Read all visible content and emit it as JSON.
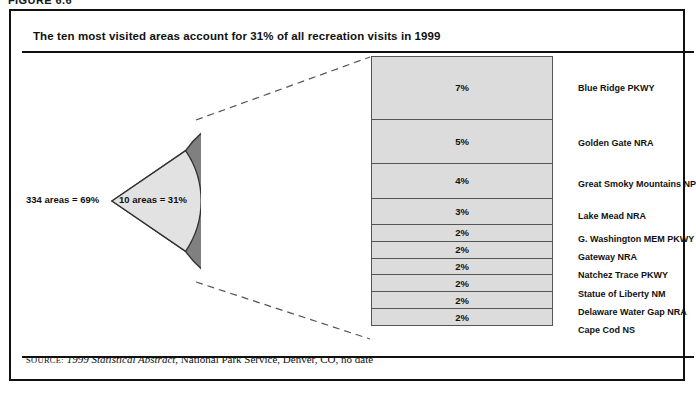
{
  "page": {
    "top_caption": "FIGURE 6.6",
    "panel_title": "The ten most visited areas account for 31% of all recreation visits in 1999"
  },
  "pie": {
    "major_label": "334 areas = 69%",
    "minor_label": "10 areas = 31%",
    "major_color": "#808080",
    "minor_color": "#e0e0e0",
    "outline_color": "#333333"
  },
  "source": {
    "kicker": "SOURCE:",
    "title": "1999 Statistical Abstract",
    "rest": ", National Park Service, Denver, CO, no date"
  },
  "chart_data": {
    "type": "bar",
    "title": "The ten most visited areas account for 31% of all recreation visits in 1999",
    "xlabel": "",
    "ylabel": "Share of all recreation visits",
    "orientation": "stacked-vertical",
    "grid": false,
    "legend": "none",
    "value_suffix": "%",
    "total": 31,
    "categories": [
      "Blue Ridge PKWY",
      "Golden Gate NRA",
      "Great Smoky Mountains NP",
      "Lake Mead NRA",
      "G. Washington MEM PKWY",
      "Gateway NRA",
      "Natchez Trace PKWY",
      "Statue of Liberty NM",
      "Delaware Water Gap NRA",
      "Cape Cod NS"
    ],
    "values": [
      7,
      5,
      4,
      3,
      2,
      2,
      2,
      2,
      2,
      2
    ],
    "value_labels": [
      "7%",
      "5%",
      "4%",
      "3%",
      "2%",
      "2%",
      "2%",
      "2%",
      "2%",
      "2%"
    ],
    "bar_fill": "#dcdcdc",
    "bar_stroke": "#555555"
  },
  "pie_data": {
    "type": "pie",
    "title": "Share of recreation visits by number of areas, 1999",
    "labels": [
      "334 areas = 69%",
      "10 areas = 31%"
    ],
    "values": [
      69,
      31
    ],
    "colors": [
      "#808080",
      "#e0e0e0"
    ]
  }
}
